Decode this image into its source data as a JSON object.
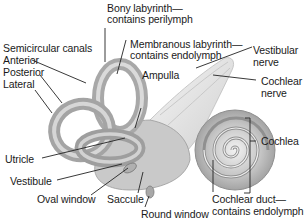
{
  "diagram": {
    "colors": {
      "bone": "#b8b8b8",
      "bone_light": "#dcdcdc",
      "bone_dark": "#8a8a8a",
      "nerve": "#e4e4e4",
      "line": "#222222",
      "text": "#1a1a1a"
    },
    "labels": {
      "bony_labyrinth_1": "Bony labyrinth—",
      "bony_labyrinth_2": "contains perilymph",
      "membranous_labyrinth_1": "Membranous labyrinth—",
      "membranous_labyrinth_2": "contains endolymph",
      "vestibular_nerve_1": "Vestibular",
      "vestibular_nerve_2": "nerve",
      "cochlear_nerve_1": "Cochlear",
      "cochlear_nerve_2": "nerve",
      "semicircular_canals": "Semicircular canals",
      "anterior": "Anterior",
      "posterior": "Posterior",
      "lateral": "Lateral",
      "ampulla": "Ampulla",
      "cochlea": "Cochlea",
      "utricle": "Utricle",
      "vestibule": "Vestibule",
      "oval_window": "Oval window",
      "saccule": "Saccule",
      "round_window": "Round window",
      "cochlear_duct_1": "Cochlear duct—",
      "cochlear_duct_2": "contains endolymph"
    }
  }
}
